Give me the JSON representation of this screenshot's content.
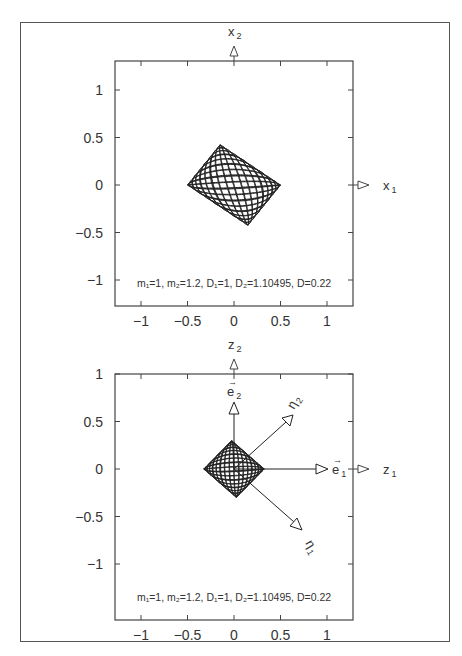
{
  "chart_data": [
    {
      "type": "line",
      "title": "",
      "xlabel": "x_1",
      "ylabel": "x_2",
      "xlim": [
        -1.3,
        1.3
      ],
      "ylim": [
        -1.3,
        1.3
      ],
      "xticks": [
        -1,
        -0.5,
        0,
        0.5,
        1
      ],
      "yticks": [
        -1,
        -0.5,
        0,
        0.5,
        1
      ],
      "xtick_labels": [
        "−1",
        "−0.5",
        "0",
        "0.5",
        "1"
      ],
      "ytick_labels": [
        "−1",
        "−0.5",
        "0",
        "0.5",
        "1"
      ],
      "grid": false,
      "annotation": "m1=1, m2=1.2, D1=1, D2=1.10495, D=0.22",
      "description": "Lissajous-type trajectory filling a tilted parallelogram; extreme points approx (-1,0), (1,0), (0.3,-0.85), (-0.3,0.85)",
      "envelope_vertices": [
        [
          -1.0,
          0.0
        ],
        [
          -0.3,
          0.85
        ],
        [
          1.0,
          0.0
        ],
        [
          0.3,
          -0.85
        ]
      ]
    },
    {
      "type": "line",
      "title": "",
      "xlabel": "z_1",
      "ylabel": "z_2",
      "xlim": [
        -1.3,
        1.3
      ],
      "ylim": [
        -1.3,
        1.3
      ],
      "xticks": [
        -1,
        -0.5,
        0,
        0.5,
        1
      ],
      "yticks": [
        -1,
        -0.5,
        0,
        0.5,
        1
      ],
      "xtick_labels": [
        "−1",
        "−0.5",
        "0",
        "0.5",
        "1"
      ],
      "ytick_labels": [
        "−1",
        "−0.5",
        "0",
        "0.5",
        "1"
      ],
      "grid": false,
      "annotation": "m1=1, m2=1.2, D1=1, D2=1.10495, D=0.22",
      "vectors": [
        {
          "name": "e_1",
          "from": [
            0,
            0
          ],
          "to": [
            0.6,
            0
          ]
        },
        {
          "name": "e_2",
          "from": [
            0,
            0
          ],
          "to": [
            0,
            0.6
          ]
        },
        {
          "name": "eta_1",
          "from": [
            0,
            0
          ],
          "to": [
            0.5,
            -0.5
          ]
        },
        {
          "name": "eta_2",
          "from": [
            0,
            0
          ],
          "to": [
            0.4,
            0.55
          ]
        }
      ],
      "description": "Scaled trajectory (mass-weighted coordinates) with basis vectors e1, e2 and normal-mode directions eta1, eta2; extreme points approx (-0.65,0), (0.65,0), (-0.05,0.6), (0.2,-0.65)",
      "envelope_vertices": [
        [
          -0.65,
          0.0
        ],
        [
          -0.05,
          0.6
        ],
        [
          0.65,
          0.0
        ],
        [
          0.2,
          -0.65
        ]
      ]
    }
  ],
  "plots": {
    "top": {
      "xlabel_main": "x",
      "xlabel_sub": "1",
      "ylabel_main": "x",
      "ylabel_sub": "2",
      "params": "m₁=1,  m₂=1.2,  D₁=1,  D₂=1.10495,  D=0.22"
    },
    "bottom": {
      "xlabel_main": "z",
      "xlabel_sub": "1",
      "ylabel_main": "z",
      "ylabel_sub": "2",
      "params": "m₁=1,  m₂=1.2,  D₁=1,  D₂=1.10495,  D=0.22",
      "vector_labels": {
        "e1": "e",
        "e1_sub": "1",
        "e2": "e",
        "e2_sub": "2",
        "eta1": "η",
        "eta1_sub": "1",
        "eta2": "η",
        "eta2_sub": "2"
      }
    },
    "ticks": [
      "−1",
      "−0.5",
      "0",
      "0.5",
      "1"
    ]
  }
}
